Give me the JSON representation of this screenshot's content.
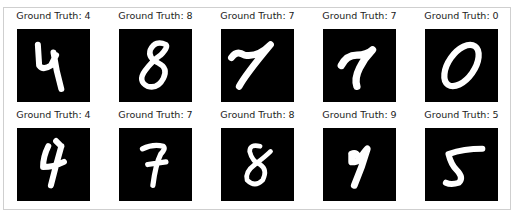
{
  "figure": {
    "title_prefix": "Ground Truth:",
    "rows": [
      [
        {
          "label": "Ground Truth: 4",
          "digit": "4"
        },
        {
          "label": "Ground Truth: 8",
          "digit": "8"
        },
        {
          "label": "Ground Truth: 7",
          "digit": "7"
        },
        {
          "label": "Ground Truth: 7",
          "digit": "7"
        },
        {
          "label": "Ground Truth: 0",
          "digit": "0"
        }
      ],
      [
        {
          "label": "Ground Truth: 4",
          "digit": "4"
        },
        {
          "label": "Ground Truth: 7",
          "digit": "7"
        },
        {
          "label": "Ground Truth: 8",
          "digit": "8"
        },
        {
          "label": "Ground Truth: 9",
          "digit": "9"
        },
        {
          "label": "Ground Truth: 5",
          "digit": "5"
        }
      ]
    ],
    "colors": {
      "image_background": "#000000",
      "digit_stroke": "#ffffff",
      "frame_border": "#cfcfcf"
    }
  }
}
